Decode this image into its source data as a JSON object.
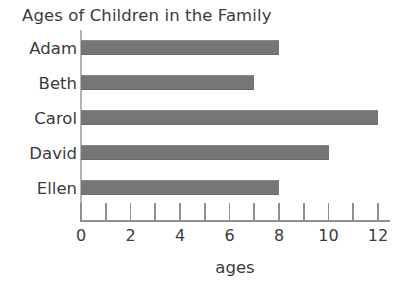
{
  "chart_data": {
    "type": "bar",
    "orientation": "horizontal",
    "title": "Ages of Children in the Family",
    "xlabel": "ages",
    "ylabel": "",
    "categories": [
      "Adam",
      "Beth",
      "Carol",
      "David",
      "Ellen"
    ],
    "values": [
      8,
      7,
      12,
      10,
      8
    ],
    "xlim": [
      0,
      12.5
    ],
    "x_tick_positions": [
      0,
      1,
      2,
      3,
      4,
      5,
      6,
      7,
      8,
      9,
      10,
      11,
      12
    ],
    "x_tick_labels": [
      "0",
      "",
      "2",
      "",
      "4",
      "",
      "6",
      "",
      "8",
      "",
      "10",
      "",
      "12"
    ],
    "x_labeled_ticks": [
      "0",
      "2",
      "4",
      "6",
      "8",
      "10",
      "12"
    ],
    "grid": false,
    "legend": false,
    "legend_position": "none",
    "bar_color": "#767676",
    "axis_color": "#8f8f8f",
    "text_color": "#3b3b3b",
    "background_color": "#ffffff"
  }
}
